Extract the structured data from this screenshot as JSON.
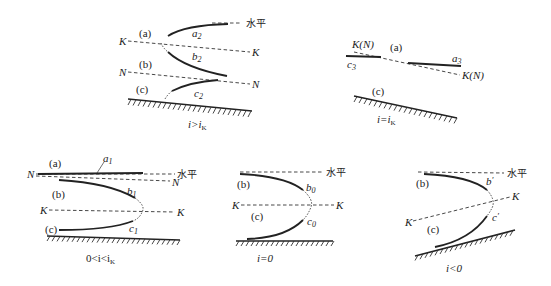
{
  "figure": {
    "panels": [
      {
        "id": "steep",
        "caption": "i>i",
        "caption_sub": "K",
        "zones": [
          "(a)",
          "(b)",
          "(c)"
        ],
        "lines": {
          "K_left": "K",
          "K_right": "K",
          "N_left": "N",
          "N_right": "N",
          "horizontal": "水平"
        },
        "curves": [
          {
            "name": "a",
            "sub": "2"
          },
          {
            "name": "b",
            "sub": "2"
          },
          {
            "name": "c",
            "sub": "2"
          }
        ]
      },
      {
        "id": "critical",
        "caption": "i=i",
        "caption_sub": "K",
        "zones": [
          "(a)",
          "(c)"
        ],
        "lines": {
          "KN_left": "K(N)",
          "KN_right": "K(N)"
        },
        "curves": [
          {
            "name": "a",
            "sub": "3"
          },
          {
            "name": "c",
            "sub": "3"
          }
        ]
      },
      {
        "id": "mild",
        "caption": "0<i<i",
        "caption_sub": "K",
        "zones": [
          "(a)",
          "(b)",
          "(c)"
        ],
        "lines": {
          "N_left": "N",
          "N_right": "N",
          "K_left": "K",
          "K_right": "K",
          "horizontal": "水平"
        },
        "curves": [
          {
            "name": "a",
            "sub": "1"
          },
          {
            "name": "b",
            "sub": "1"
          },
          {
            "name": "c",
            "sub": "1"
          }
        ]
      },
      {
        "id": "horizontal",
        "caption": "i=0",
        "zones": [
          "(b)",
          "(c)"
        ],
        "lines": {
          "K_left": "K",
          "K_right": "K",
          "horizontal": "水平"
        },
        "curves": [
          {
            "name": "b",
            "sub": "0"
          },
          {
            "name": "c",
            "sub": "0"
          }
        ]
      },
      {
        "id": "adverse",
        "caption": "i<0",
        "zones": [
          "(b)",
          "(c)"
        ],
        "lines": {
          "K_left": "K",
          "K_right": "K",
          "horizontal": "水平"
        },
        "curves": [
          {
            "name": "b",
            "sub": "′"
          },
          {
            "name": "c",
            "sub": "′"
          }
        ]
      }
    ]
  }
}
